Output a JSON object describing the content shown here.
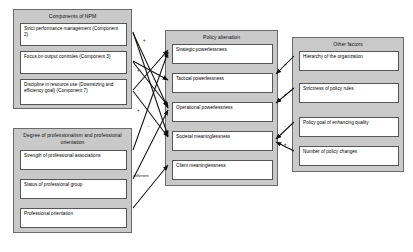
{
  "diagram": {
    "groups": [
      {
        "id": "npm",
        "title": "Components of NPM",
        "items": [
          "Strict performance management (Component 2)",
          "Focus on output controles (Component 3)",
          "Discipline in resource use (Downsizing and efficiency goal) (Component 7)"
        ]
      },
      {
        "id": "professionalism",
        "title": "Degree of professionalism and professional orientation",
        "items": [
          "Strength of professional associations",
          "Status of professional group",
          "Professional orientation"
        ]
      },
      {
        "id": "alienation",
        "title": "Policy alienation",
        "items": [
          "Strategic powerlessness",
          "Tactical powerlessness",
          "Operational powerlessness",
          "Societal meaninglessness",
          "Client meaninglessness"
        ]
      },
      {
        "id": "other",
        "title": "Other factors",
        "items": [
          "Hierarchy of the organization",
          "Strictness of policy rules",
          "Policy goal of enhancing quality",
          "Number of policy changes"
        ]
      }
    ],
    "edge_labels": [
      {
        "id": "different",
        "text": "different"
      }
    ],
    "edge_signs": [
      {
        "id": "s1",
        "text": "+"
      },
      {
        "id": "s2",
        "text": "+"
      },
      {
        "id": "s3",
        "text": "-"
      },
      {
        "id": "s4",
        "text": "+"
      },
      {
        "id": "s5",
        "text": "-"
      },
      {
        "id": "s6",
        "text": "+"
      },
      {
        "id": "s7",
        "text": "+"
      },
      {
        "id": "s8",
        "text": "-"
      },
      {
        "id": "s9",
        "text": "+"
      }
    ],
    "colors": {
      "group_fill": "#c9c9c9",
      "group_border": "#6b6b6b",
      "node_fill": "#ffffff",
      "node_border": "#555555",
      "arrow": "#111111",
      "page_background": "#ffffff"
    }
  }
}
